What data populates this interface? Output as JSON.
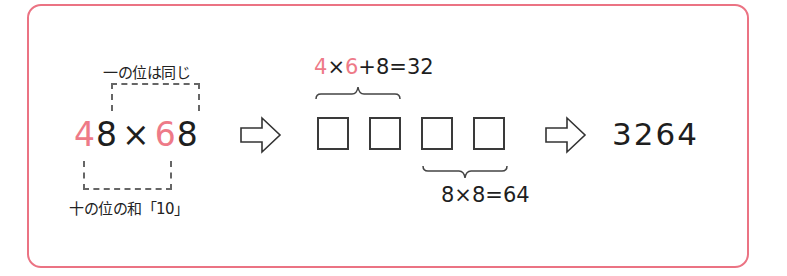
{
  "diagram": {
    "colors": {
      "border": "#eb7383",
      "highlight": "#ee7a88",
      "text": "#1e1e1e"
    },
    "labels": {
      "ones_same": "一の位は同じ",
      "tens_sum": "十の位の和「10」"
    },
    "expression": {
      "tens_a": "4",
      "ones_a": "8",
      "times": "×",
      "tens_b": "6",
      "ones_b": "8"
    },
    "top_formula": {
      "a": "4",
      "times": "×",
      "b": "6",
      "rest": "+8=32"
    },
    "bottom_formula": "8×8=64",
    "boxes_count": 4,
    "result": "3264",
    "icons": [
      "right-arrow-icon",
      "right-arrow-icon"
    ]
  }
}
